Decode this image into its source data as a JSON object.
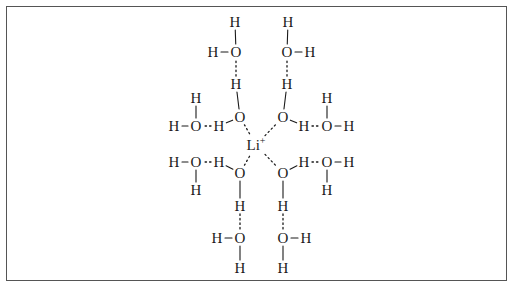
{
  "figure": {
    "background_color": "#ffffff",
    "frame_color": "#555555",
    "text_color": "#1a1a1a",
    "bond_color": "#1a1a1a"
  },
  "chart_data": {
    "type": "diagram",
    "center_ion": {
      "label": "Li",
      "charge": "+",
      "x": 256,
      "y": 145
    },
    "atoms": [
      {
        "id": "a1",
        "element": "H",
        "x": 235,
        "y": 22
      },
      {
        "id": "a2",
        "element": "H",
        "x": 288,
        "y": 22
      },
      {
        "id": "a3",
        "element": "H",
        "x": 213,
        "y": 52
      },
      {
        "id": "a4",
        "element": "O",
        "x": 236,
        "y": 52
      },
      {
        "id": "a5",
        "element": "O",
        "x": 287,
        "y": 52
      },
      {
        "id": "a6",
        "element": "H",
        "x": 310,
        "y": 52
      },
      {
        "id": "a7",
        "element": "H",
        "x": 236,
        "y": 84
      },
      {
        "id": "a8",
        "element": "H",
        "x": 287,
        "y": 84
      },
      {
        "id": "a9",
        "element": "H",
        "x": 196,
        "y": 98
      },
      {
        "id": "a10",
        "element": "H",
        "x": 327,
        "y": 98
      },
      {
        "id": "a11",
        "element": "H",
        "x": 174,
        "y": 126
      },
      {
        "id": "a12",
        "element": "O",
        "x": 196,
        "y": 126
      },
      {
        "id": "a13",
        "element": "H",
        "x": 219,
        "y": 126
      },
      {
        "id": "a14",
        "element": "O",
        "x": 240,
        "y": 117
      },
      {
        "id": "a15",
        "element": "O",
        "x": 283,
        "y": 117
      },
      {
        "id": "a16",
        "element": "H",
        "x": 304,
        "y": 126
      },
      {
        "id": "a17",
        "element": "O",
        "x": 327,
        "y": 126
      },
      {
        "id": "a18",
        "element": "H",
        "x": 349,
        "y": 126
      },
      {
        "id": "a19",
        "element": "H",
        "x": 174,
        "y": 162
      },
      {
        "id": "a20",
        "element": "O",
        "x": 196,
        "y": 162
      },
      {
        "id": "a21",
        "element": "H",
        "x": 219,
        "y": 162
      },
      {
        "id": "a22",
        "element": "O",
        "x": 240,
        "y": 173
      },
      {
        "id": "a23",
        "element": "O",
        "x": 283,
        "y": 173
      },
      {
        "id": "a24",
        "element": "H",
        "x": 304,
        "y": 162
      },
      {
        "id": "a25",
        "element": "O",
        "x": 327,
        "y": 162
      },
      {
        "id": "a26",
        "element": "H",
        "x": 349,
        "y": 162
      },
      {
        "id": "a27",
        "element": "H",
        "x": 196,
        "y": 190
      },
      {
        "id": "a28",
        "element": "H",
        "x": 327,
        "y": 190
      },
      {
        "id": "a29",
        "element": "H",
        "x": 240,
        "y": 206
      },
      {
        "id": "a30",
        "element": "H",
        "x": 283,
        "y": 206
      },
      {
        "id": "a31",
        "element": "H",
        "x": 217,
        "y": 238
      },
      {
        "id": "a32",
        "element": "O",
        "x": 240,
        "y": 238
      },
      {
        "id": "a33",
        "element": "O",
        "x": 283,
        "y": 238
      },
      {
        "id": "a34",
        "element": "H",
        "x": 306,
        "y": 238
      },
      {
        "id": "a35",
        "element": "H",
        "x": 240,
        "y": 268
      },
      {
        "id": "a36",
        "element": "H",
        "x": 283,
        "y": 268
      }
    ],
    "covalent_bonds": [
      {
        "from": "a3",
        "to": "a4"
      },
      {
        "from": "a1",
        "to": "a4"
      },
      {
        "from": "a2",
        "to": "a5"
      },
      {
        "from": "a5",
        "to": "a6"
      },
      {
        "from": "a9",
        "to": "a12"
      },
      {
        "from": "a11",
        "to": "a12"
      },
      {
        "from": "a10",
        "to": "a17"
      },
      {
        "from": "a17",
        "to": "a18"
      },
      {
        "from": "a13",
        "to": "a14"
      },
      {
        "from": "a7",
        "to": "a14"
      },
      {
        "from": "a8",
        "to": "a15"
      },
      {
        "from": "a15",
        "to": "a16"
      },
      {
        "from": "a19",
        "to": "a20"
      },
      {
        "from": "a20",
        "to": "a27"
      },
      {
        "from": "a25",
        "to": "a26"
      },
      {
        "from": "a25",
        "to": "a28"
      },
      {
        "from": "a21",
        "to": "a22"
      },
      {
        "from": "a22",
        "to": "a29"
      },
      {
        "from": "a23",
        "to": "a30"
      },
      {
        "from": "a23",
        "to": "a24"
      },
      {
        "from": "a31",
        "to": "a32"
      },
      {
        "from": "a32",
        "to": "a35"
      },
      {
        "from": "a33",
        "to": "a34"
      },
      {
        "from": "a33",
        "to": "a36"
      }
    ],
    "hydrogen_bonds": [
      {
        "from": "a7",
        "to": "a4"
      },
      {
        "from": "a8",
        "to": "a5"
      },
      {
        "from": "a13",
        "to": "a12"
      },
      {
        "from": "a16",
        "to": "a17"
      },
      {
        "from": "a21",
        "to": "a20"
      },
      {
        "from": "a24",
        "to": "a25"
      },
      {
        "from": "a29",
        "to": "a32"
      },
      {
        "from": "a30",
        "to": "a33"
      }
    ],
    "coordination_bonds": [
      {
        "from": "center_ion",
        "to": "a14"
      },
      {
        "from": "center_ion",
        "to": "a15"
      },
      {
        "from": "center_ion",
        "to": "a22"
      },
      {
        "from": "center_ion",
        "to": "a23"
      }
    ]
  }
}
